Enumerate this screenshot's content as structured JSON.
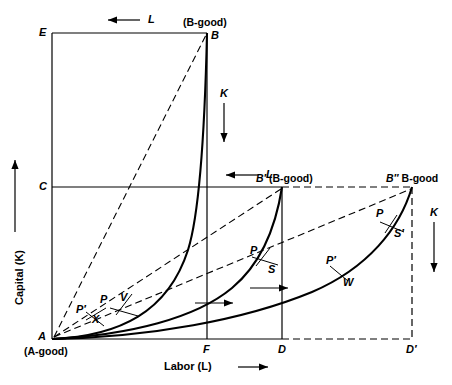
{
  "figure": {
    "type": "edgeworth-box-diagram",
    "axes": {
      "y_label": "Capital (K)",
      "x_label": "Labor (L)"
    },
    "corner_labels": {
      "E": "E",
      "B": "B",
      "C": "C",
      "A": "A",
      "F": "F",
      "D": "D",
      "D_prime": "D′",
      "B_prime": "B′",
      "B_double_prime": "B″"
    },
    "good_labels": {
      "a_good": "(A-good)",
      "b_good_top": "(B-good)",
      "b_good_mid": "(B-good)",
      "b_good_right": "B-good",
      "b_prime": "B′",
      "b_double_prime": "B″"
    },
    "tangency_labels": {
      "p_left_lower": "P′",
      "x_left": "X",
      "p_left_upper": "P",
      "v_left": "V",
      "p_mid": "P",
      "s_mid": "S",
      "p_right_lower": "P′",
      "w_right": "W",
      "p_right_upper": "P",
      "s_right": "S′"
    },
    "direction_arrows": {
      "l_top": "L",
      "l_mid": "L",
      "k_left": "K",
      "k_right": "K"
    },
    "colors": {
      "line": "#000000",
      "background": "#ffffff"
    }
  }
}
